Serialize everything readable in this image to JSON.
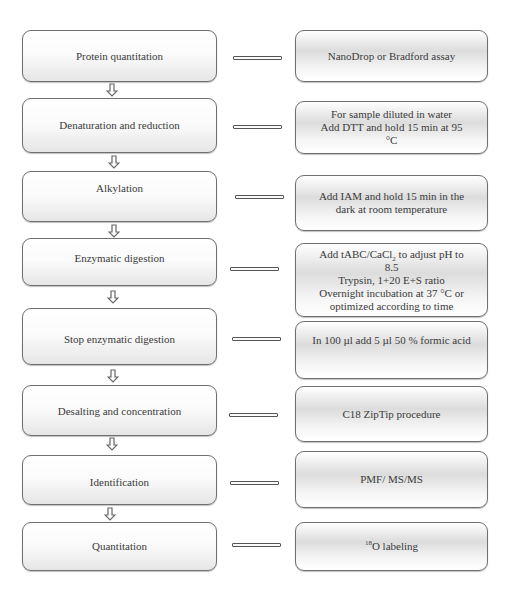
{
  "steps": [
    {
      "label": "Protein quantitation",
      "detail": "NanoDrop or Bradford assay"
    },
    {
      "label": "Denaturation and reduction",
      "detail": "For sample diluted in water\nAdd DTT and hold 15 min at 95\n°C"
    },
    {
      "label": "Alkylation",
      "detail": "Add IAM and hold 15 min in the\ndark at room temperature"
    },
    {
      "label": "Enzymatic digestion",
      "detail_parts": {
        "pre": "Add tABC/CaCl",
        "sub": "2",
        "post": " to adjust pH to\n8.5\nTrypsin, 1+20 E+S ratio\nOvernight incubation at 37 °C or\noptimized according to time"
      }
    },
    {
      "label": "Stop enzymatic digestion",
      "detail": "In 100 µl add 5 µl 50 % formic acid"
    },
    {
      "label": "Desalting and concentration",
      "detail": "C18 ZipTip procedure"
    },
    {
      "label": "Identification",
      "detail": "PMF/ MS/MS"
    },
    {
      "label": "Quantitation",
      "detail_parts": {
        "sup": "18",
        "post": "O labeling"
      }
    }
  ],
  "icons": {
    "flow_arrow": "down-outline-arrow-icon",
    "connector": "double-line-connector"
  },
  "colors": {
    "border": "#6f6f6f",
    "text": "#3a3a3a",
    "background": "#ffffff"
  }
}
